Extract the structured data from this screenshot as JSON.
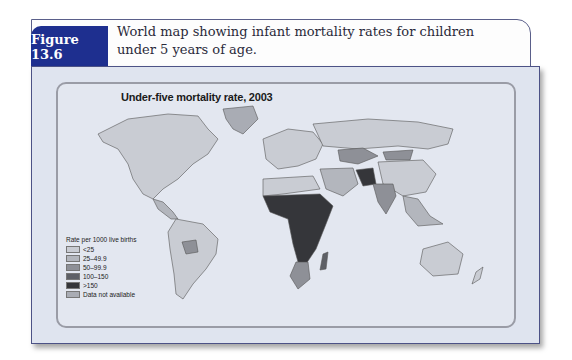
{
  "figure": {
    "label": "Figure 13.6",
    "caption": "World map showing infant mortality rates for children under 5 years of age."
  },
  "map": {
    "title": "Under-five mortality rate, 2003",
    "legend": {
      "title": "Rate per 1000 live births",
      "items": [
        {
          "label": "<25",
          "color": "#c9ccd3"
        },
        {
          "label": "25–49.9",
          "color": "#b3b6bd"
        },
        {
          "label": "50–99.9",
          "color": "#8e9097"
        },
        {
          "label": "100–150",
          "color": "#5e6066"
        },
        {
          "label": ">150",
          "color": "#35363a"
        },
        {
          "label": "Data not available",
          "color": "#a9acb4"
        }
      ]
    }
  },
  "colors": {
    "figure_label_bg": "#1e2f8f",
    "panel_bg": "#dfe4ef",
    "panel_border": "#4c5286"
  }
}
